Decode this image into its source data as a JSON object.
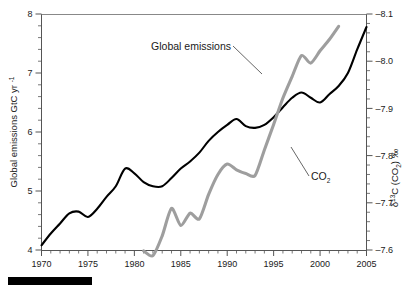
{
  "chart_data": {
    "type": "line",
    "title": "",
    "xlabel": "",
    "grid": false,
    "legend_position": "inline-annotations",
    "xlim": [
      1970,
      2005
    ],
    "x_major_ticks": [
      1970,
      1975,
      1980,
      1985,
      1990,
      1995,
      2000,
      2005
    ],
    "x_tick_labels": [
      "1970",
      "1975",
      "1980",
      "1985",
      "1990",
      "1995",
      "2000",
      "2005"
    ],
    "x_minor_step": 1,
    "left_axis": {
      "label": "Global emissions GtC yr",
      "label_sup": "-1",
      "ylim": [
        4,
        8
      ],
      "ticks": [
        4,
        5,
        6,
        7,
        8
      ],
      "tick_labels": [
        "4",
        "5",
        "6",
        "7",
        "8"
      ],
      "minor_step": 0.2
    },
    "right_axis": {
      "label_delta": "δ",
      "label_sup": "13",
      "label_rest": "C (CO",
      "label_sub": "2",
      "label_tail": ") ‰",
      "ylim": [
        -7.6,
        -8.1
      ],
      "inverted": true,
      "ticks": [
        -7.6,
        -7.7,
        -7.8,
        -7.9,
        -8.0,
        -8.1
      ],
      "tick_labels": [
        "–7.6",
        "–7.7",
        "–7.8",
        "–7.9",
        "–8.0",
        "–8.1"
      ],
      "minor_step": 0.02
    },
    "series": [
      {
        "name": "Global emissions",
        "color": "#000000",
        "axis": "left",
        "units": "GtC yr-1",
        "x": [
          1970,
          1971,
          1972,
          1973,
          1974,
          1975,
          1976,
          1977,
          1978,
          1979,
          1980,
          1981,
          1982,
          1983,
          1984,
          1985,
          1986,
          1987,
          1988,
          1989,
          1990,
          1991,
          1992,
          1993,
          1994,
          1995,
          1996,
          1997,
          1998,
          1999,
          2000,
          2001,
          2002,
          2003,
          2004,
          2005
        ],
        "values": [
          4.08,
          4.28,
          4.45,
          4.62,
          4.65,
          4.56,
          4.7,
          4.9,
          5.08,
          5.38,
          5.3,
          5.15,
          5.08,
          5.08,
          5.22,
          5.38,
          5.5,
          5.65,
          5.85,
          6.0,
          6.12,
          6.22,
          6.1,
          6.07,
          6.12,
          6.25,
          6.42,
          6.58,
          6.67,
          6.58,
          6.5,
          6.64,
          6.78,
          7.0,
          7.4,
          7.78
        ]
      },
      {
        "name": "CO2",
        "color": "#9e9e9e",
        "axis": "right",
        "units": "per mil",
        "x": [
          1981,
          1982,
          1983,
          1984,
          1985,
          1986,
          1987,
          1988,
          1989,
          1990,
          1991,
          1992,
          1993,
          1994,
          1995,
          1996,
          1997,
          1998,
          1999,
          2000,
          2001,
          2002
        ],
        "values": [
          -7.598,
          -7.588,
          -7.63,
          -7.688,
          -7.652,
          -7.678,
          -7.666,
          -7.718,
          -7.76,
          -7.782,
          -7.77,
          -7.762,
          -7.758,
          -7.812,
          -7.866,
          -7.922,
          -7.968,
          -8.012,
          -7.996,
          -8.022,
          -8.046,
          -8.074
        ]
      }
    ],
    "annotations": [
      {
        "name": "global-emissions-annotation",
        "text": "Global emissions",
        "leader_from": [
          233,
          46
        ],
        "leader_to": [
          262,
          74
        ]
      },
      {
        "name": "co2-annotation",
        "text": "CO",
        "text_sub": "2",
        "leader_from": [
          291,
          147
        ],
        "leader_to": [
          309,
          176
        ]
      }
    ],
    "scale_bar": {
      "name": "black-scale-bar",
      "color": "#000000",
      "x": 8,
      "y": 277,
      "width": 84,
      "height": 8
    },
    "colors": {
      "emissions_line": "#000000",
      "co2_line": "#9e9e9e",
      "axis": "#4d4d4d",
      "text": "#1a1a1a",
      "background": "#ffffff"
    }
  }
}
